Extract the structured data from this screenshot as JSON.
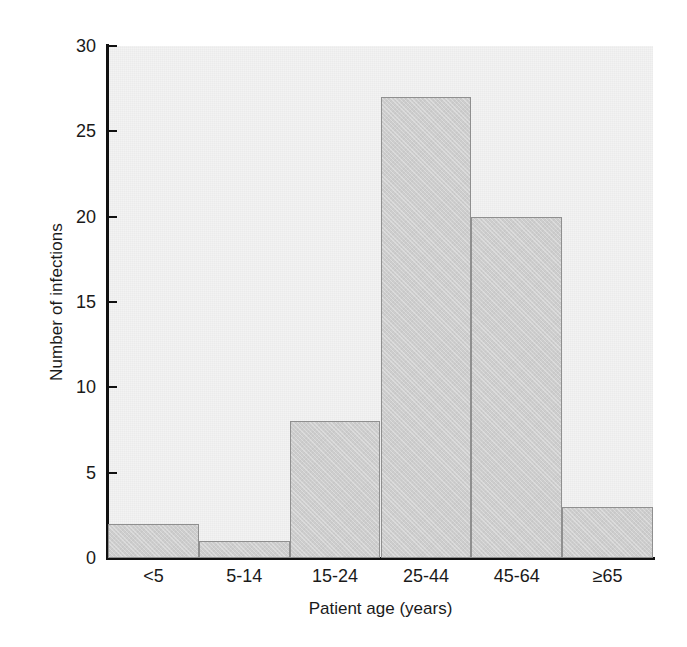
{
  "chart_data": {
    "type": "bar",
    "title": "",
    "subtitle": "",
    "xlabel": "Patient age (years)",
    "ylabel": "Number of infections",
    "categories": [
      "<5",
      "5-14",
      "15-24",
      "25-44",
      "45-64",
      "≥65"
    ],
    "values": [
      2,
      1,
      8,
      27,
      20,
      3
    ],
    "ylim": [
      0,
      30
    ],
    "yticks": [
      0,
      5,
      10,
      15,
      20,
      25,
      30
    ],
    "ytick_labels": [
      "0",
      "5",
      "10",
      "15",
      "20",
      "25",
      "30"
    ],
    "xlim": [
      0,
      6
    ],
    "grid": false,
    "legend": null,
    "annotations": [],
    "style": {
      "bar_fill": "#cdcdcd",
      "bar_edge": "#8f8f8f",
      "plot_background": "#f3f3f3",
      "axis_color": "#111111",
      "text_color": "#1a1a1a",
      "figure_background": "#ffffff"
    }
  }
}
